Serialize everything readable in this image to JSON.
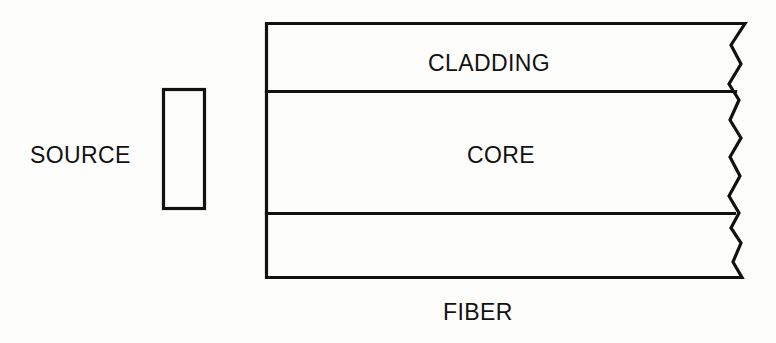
{
  "diagram": {
    "background_color": "#fdfdfc",
    "stroke_color": "#111111",
    "labels": {
      "source": "SOURCE",
      "cladding": "CLADDING",
      "core": "CORE",
      "fiber": "FIBER"
    },
    "shapes": {
      "source_box": {
        "name": "source-emitter-box",
        "x": 162,
        "y": 88,
        "width": 43,
        "height": 121
      },
      "fiber_body": {
        "name": "fiber-body",
        "left": 265,
        "top": 22,
        "right": 730,
        "bottom": 279,
        "cladding_divider_y": 91,
        "core_divider_y": 213
      },
      "break_edge": {
        "name": "jagged-break-edge",
        "description": "zigzag break line at right end of fiber indicating continuation"
      }
    }
  }
}
